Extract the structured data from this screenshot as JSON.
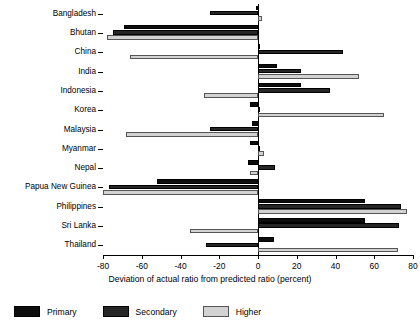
{
  "chart_data": {
    "type": "bar",
    "orientation": "horizontal",
    "title": "",
    "xlabel": "Deviation of actual ratio from predicted ratio (percent)",
    "ylabel": "",
    "xlim": [
      -80,
      80
    ],
    "xticks": [
      -80,
      -60,
      -40,
      -20,
      0,
      20,
      40,
      60,
      80
    ],
    "xticklabels": [
      "-80",
      "-60",
      "-40",
      "-20",
      "0",
      "20",
      "40",
      "60",
      "80"
    ],
    "grid": false,
    "legend_position": "bottom-left",
    "categories": [
      "Bangladesh",
      "Bhutan",
      "China",
      "India",
      "Indonesia",
      "Korea",
      "Malaysia",
      "Myanmar",
      "Nepal",
      "Papua New Guinea",
      "Philippines",
      "Sri Lanka",
      "Thailand"
    ],
    "series": [
      {
        "name": "Primary",
        "color": "#0d0d0d",
        "values": [
          -1,
          -69,
          1,
          10,
          22,
          -4,
          -3,
          -4,
          -5,
          -52,
          55,
          55,
          8
        ]
      },
      {
        "name": "Secondary",
        "color": "#262626",
        "values": [
          -25,
          -75,
          44,
          22,
          37,
          1,
          -25,
          1,
          9,
          -77,
          74,
          73,
          -27
        ]
      },
      {
        "name": "Higher",
        "color": "#d2d2d2",
        "values": [
          2,
          -78,
          -66,
          52,
          -28,
          65,
          -68,
          3,
          -4,
          -80,
          77,
          -35,
          72
        ]
      }
    ]
  },
  "legend": {
    "items": [
      {
        "label": "Primary"
      },
      {
        "label": "Secondary"
      },
      {
        "label": "Higher"
      }
    ]
  }
}
